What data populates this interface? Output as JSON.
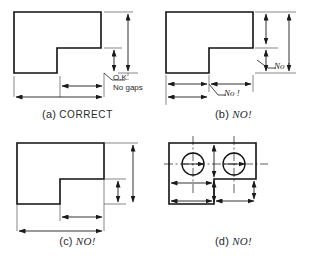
{
  "figure": {
    "background_color": "#ffffff",
    "line_color": "#1a1a1a",
    "object_line_color": "#111111",
    "thin_line_color": "#555555"
  },
  "panels": [
    {
      "id": "a",
      "caption_index": "(a)",
      "caption_verdict": "CORRECT",
      "verdict_style": "upright",
      "annotations": [
        {
          "name": "ok-note",
          "line1": "O.K.",
          "line2": "No gaps"
        }
      ],
      "dimensions": [
        {
          "name": "overall-height",
          "orientation": "vertical",
          "position": "right-outer"
        },
        {
          "name": "notch-height",
          "orientation": "vertical",
          "position": "right-inner"
        },
        {
          "name": "notch-width",
          "orientation": "horizontal",
          "position": "bottom-inner"
        },
        {
          "name": "overall-width",
          "orientation": "horizontal",
          "position": "bottom-outer"
        }
      ],
      "shape": "notched-rectangle"
    },
    {
      "id": "b",
      "caption_index": "(b)",
      "caption_verdict": "NO!",
      "verdict_style": "italic",
      "annotations": [
        {
          "name": "no-note-right",
          "line1": "No !",
          "line2": ""
        },
        {
          "name": "no-note-bottom",
          "line1": "No !",
          "line2": ""
        }
      ],
      "dimensions": [
        {
          "name": "overall-height",
          "orientation": "vertical",
          "position": "right-outer"
        },
        {
          "name": "notch-height",
          "orientation": "vertical",
          "position": "right-inner"
        },
        {
          "name": "notch-width",
          "orientation": "horizontal",
          "position": "bottom-inner"
        },
        {
          "name": "overall-width",
          "orientation": "horizontal",
          "position": "bottom-outer"
        }
      ],
      "shape": "notched-rectangle"
    },
    {
      "id": "c",
      "caption_index": "(c)",
      "caption_verdict": "NO!",
      "verdict_style": "italic",
      "annotations": [],
      "dimensions": [
        {
          "name": "overall-height",
          "orientation": "vertical",
          "position": "right-outer"
        },
        {
          "name": "notch-height",
          "orientation": "vertical",
          "position": "right-inner"
        },
        {
          "name": "notch-width",
          "orientation": "horizontal",
          "position": "bottom-inner"
        },
        {
          "name": "overall-width",
          "orientation": "horizontal",
          "position": "bottom-outer"
        }
      ],
      "shape": "notched-rectangle"
    },
    {
      "id": "d",
      "caption_index": "(d)",
      "caption_verdict": "NO!",
      "verdict_style": "italic",
      "annotations": [],
      "dimensions": [
        {
          "name": "hole-spacing",
          "orientation": "horizontal",
          "position": "inside"
        },
        {
          "name": "hole-edge-distance",
          "orientation": "vertical",
          "position": "inside"
        }
      ],
      "features": [
        {
          "name": "hole-left",
          "type": "circle"
        },
        {
          "name": "hole-right",
          "type": "circle"
        },
        {
          "name": "centerline-horizontal",
          "type": "centerline"
        },
        {
          "name": "centerline-vertical-left",
          "type": "centerline"
        },
        {
          "name": "centerline-vertical-right",
          "type": "centerline"
        }
      ],
      "shape": "notched-rectangle-with-holes"
    }
  ]
}
